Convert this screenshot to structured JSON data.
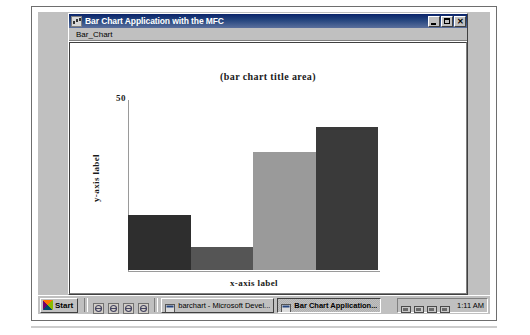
{
  "window": {
    "title": "Bar Chart Application with the MFC",
    "icon": "app-window-icon",
    "controls": {
      "minimize": "_",
      "maximize": "□",
      "close": "✕"
    }
  },
  "menu": {
    "items": [
      {
        "label": "Bar_Chart"
      }
    ]
  },
  "chart_data": {
    "type": "bar",
    "title": "(bar chart title area)",
    "xlabel": "x-axis label",
    "ylabel": "y-axis label",
    "categories": [
      "",
      "",
      "",
      ""
    ],
    "values": [
      22,
      9,
      47,
      57
    ],
    "ylim": [
      0,
      68
    ],
    "yticks": [
      50
    ],
    "ytick_labels": [
      "50"
    ],
    "grid": false,
    "legend": "none",
    "bar_colors": [
      "#2e2e2e",
      "#555555",
      "#9a9a9a",
      "#3a3a3a"
    ]
  },
  "taskbar": {
    "start_label": "Start",
    "quick_launch": [
      {
        "name": "internet-explorer-icon"
      },
      {
        "name": "network-icon"
      },
      {
        "name": "show-desktop-icon"
      },
      {
        "name": "media-player-icon"
      }
    ],
    "tasks": [
      {
        "label": "barchart - Microsoft Devel...",
        "icon": "visual-studio-icon",
        "active": false
      },
      {
        "label": "Bar Chart Application...",
        "icon": "app-window-icon",
        "active": true
      }
    ],
    "tray_icons": [
      {
        "name": "network-status-icon"
      },
      {
        "name": "volume-icon"
      },
      {
        "name": "clock-tray-icon"
      },
      {
        "name": "printer-icon"
      }
    ],
    "clock": "1:11 AM"
  }
}
